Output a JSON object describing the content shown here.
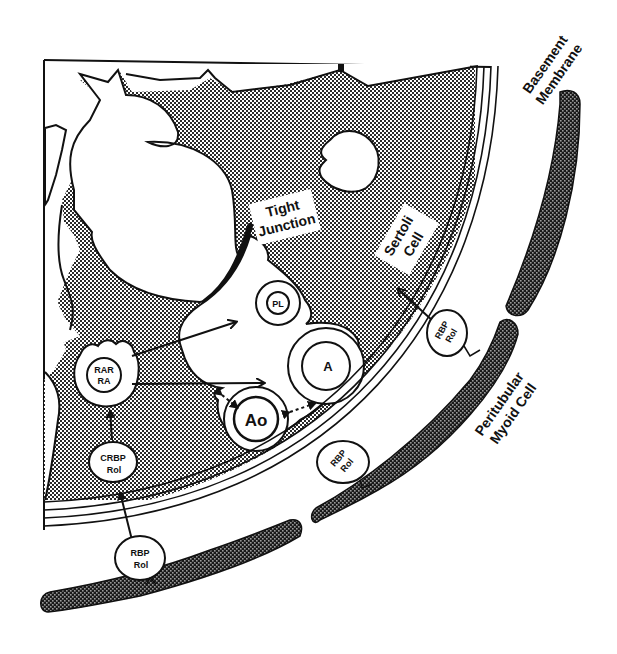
{
  "figure": {
    "type": "schematic"
  },
  "labels": {
    "basement_membrane": [
      "Basement",
      "Membrane"
    ],
    "tight_junction": [
      "Tight",
      "Junction"
    ],
    "sertoli_cell": [
      "Sertoli",
      "Cell"
    ],
    "peritubular_myoid_cell": [
      "Peritubular",
      "Myoid Cell"
    ]
  },
  "nodes": {
    "rar_ra": [
      "RAR",
      "RA"
    ],
    "crbp_rol": [
      "CRBP",
      "Rol"
    ],
    "rbp_rol_bottom": [
      "RBP",
      "Rol"
    ],
    "rbp_rol_middle": [
      "RBP",
      "Rol"
    ],
    "rbp_rol_right": [
      "RBP",
      "Rol"
    ],
    "pl": "PL",
    "a": "A",
    "ao": "Ao"
  },
  "colors": {
    "ink": "#111111",
    "background": "#ffffff",
    "sertoli_fill": "#9a9a9a",
    "myoid_fill": "#3a3a3a"
  }
}
